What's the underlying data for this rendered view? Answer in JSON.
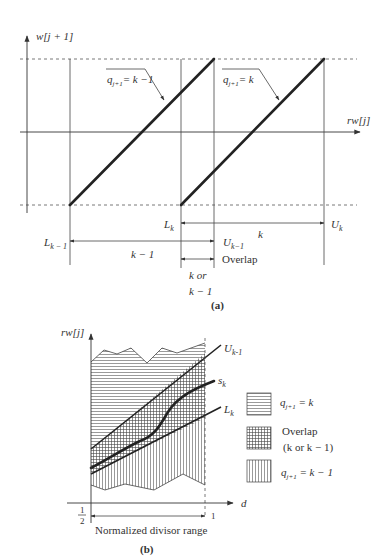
{
  "figure_a": {
    "caption": "(a)",
    "y_axis_label": "w[j + 1]",
    "x_axis_label": "rw[j]",
    "line_labels": {
      "left": {
        "q": "q",
        "sub": "j+1",
        "rhs": "= k −1"
      },
      "right": {
        "q": "q",
        "sub": "j+1",
        "rhs": "= k"
      }
    },
    "markers": {
      "L_km1": {
        "main": "L",
        "sub": "k − 1"
      },
      "L_k": {
        "main": "L",
        "sub": "k"
      },
      "U_km1": {
        "main": "U",
        "sub": "k−1"
      },
      "U_k": {
        "main": "U",
        "sub": "k"
      }
    },
    "range_labels": {
      "k": "k",
      "k_minus_1": "k − 1",
      "overlap": "Overlap",
      "k_or_line1": "k or",
      "k_or_line2": "k − 1"
    }
  },
  "figure_b": {
    "caption": "(b)",
    "y_axis_label": "rw[j]",
    "x_axis_label": "d",
    "x_start_num": "1",
    "x_start_den": "2",
    "x_end": "1",
    "range_label": "Normalized divisor range",
    "curves": {
      "upper": {
        "main": "U",
        "sub": "k-1"
      },
      "selection": {
        "main": "s",
        "sub": "k"
      },
      "lower": {
        "main": "L",
        "sub": "k"
      }
    },
    "legend": [
      {
        "pattern": "horizontal-lines",
        "q": "q",
        "sub": "j+1",
        "rhs": " = k"
      },
      {
        "pattern": "crosshatch",
        "line1": "Overlap",
        "line2": "(k or k − 1)"
      },
      {
        "pattern": "vertical-lines",
        "q": "q",
        "sub": "j+1",
        "rhs": " = k − 1"
      }
    ]
  }
}
